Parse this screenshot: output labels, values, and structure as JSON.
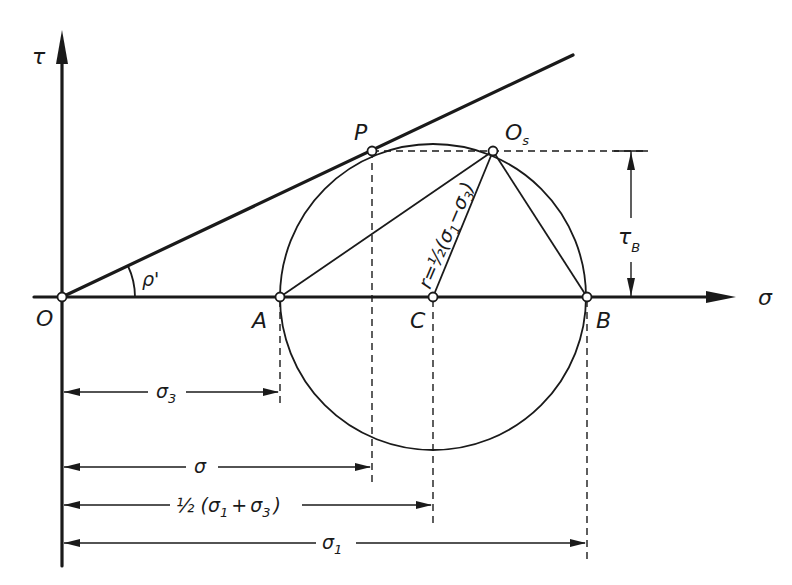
{
  "diagram": {
    "axes": {
      "horizontal_label": "σ",
      "vertical_label": "τ"
    },
    "points": {
      "origin": "O",
      "A": "A",
      "C": "C",
      "B": "B",
      "P": "P",
      "Os_main": "O",
      "Os_sub": "s"
    },
    "angle_label": "ρ'",
    "radius_label": "r = ½(σ₁−σ₃)",
    "radius_parts": {
      "r": "r",
      "eq": "=",
      "half": "½",
      "open": "(",
      "s1": "σ",
      "s1_sub": "1",
      "minus": "−",
      "s3": "σ",
      "s3_sub": "3",
      "close": ")"
    },
    "tau_b": {
      "main": "τ",
      "sub": "B"
    },
    "dimensions": [
      {
        "id": "sigma3",
        "main": "σ",
        "sub": "3"
      },
      {
        "id": "sigma",
        "main": "σ",
        "sub": ""
      },
      {
        "id": "half_sum",
        "prefix": "½ (",
        "s1": "σ",
        "s1_sub": "1",
        "plus": "+",
        "s3": "σ",
        "s3_sub": "3",
        "suffix": ")"
      },
      {
        "id": "sigma1",
        "main": "σ",
        "sub": "1"
      }
    ],
    "colors": {
      "ink": "#1a1a1a",
      "background": "#ffffff"
    }
  }
}
